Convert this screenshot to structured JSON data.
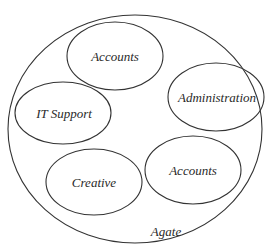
{
  "diagram": {
    "type": "nested-ellipse",
    "container": {
      "label": "Agate",
      "cx": 135,
      "cy": 129,
      "rx": 127,
      "ry": 114,
      "label_x": 166,
      "label_y": 236
    },
    "groups": [
      {
        "label": "Accounts",
        "cx": 115,
        "cy": 56,
        "rx": 48,
        "ry": 34
      },
      {
        "label": "Administration",
        "cx": 216,
        "cy": 97,
        "rx": 48,
        "ry": 34
      },
      {
        "label": "IT Support",
        "cx": 63,
        "cy": 113,
        "rx": 48,
        "ry": 30
      },
      {
        "label": "Creative",
        "cx": 94,
        "cy": 182,
        "rx": 48,
        "ry": 33
      },
      {
        "label": "Accounts",
        "cx": 193,
        "cy": 170,
        "rx": 48,
        "ry": 34
      }
    ],
    "colors": {
      "stroke": "#333333",
      "text": "#2a2a2a",
      "background": "#ffffff"
    }
  }
}
